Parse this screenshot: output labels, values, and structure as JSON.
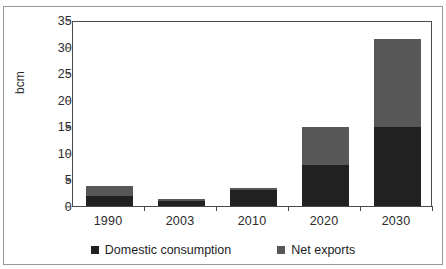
{
  "chart_data": {
    "type": "bar",
    "subtype": "stacked-column",
    "title": "",
    "xlabel": "",
    "ylabel": "bcm",
    "ylim": [
      0,
      35
    ],
    "ytick_step": 5,
    "yticks": [
      0,
      5,
      10,
      15,
      20,
      25,
      30,
      35
    ],
    "ytick_labels": [
      "0",
      "5",
      "10",
      "15",
      "20",
      "25",
      "30",
      "35"
    ],
    "categories": [
      "1990",
      "2003",
      "2010",
      "2020",
      "2030"
    ],
    "grid": false,
    "legend_position": "bottom",
    "series": [
      {
        "name": "Domestic consumption",
        "color": "#212121",
        "values": [
          2.0,
          1.2,
          3.2,
          8.0,
          15.0
        ]
      },
      {
        "name": "Net exports",
        "color": "#585858",
        "values": [
          2.0,
          0.3,
          0.4,
          7.0,
          16.7
        ]
      }
    ],
    "totals": [
      4.0,
      1.5,
      3.6,
      15.0,
      31.7
    ]
  },
  "legend": {
    "items": [
      {
        "label": "Domestic consumption",
        "color": "#212121"
      },
      {
        "label": "Net exports",
        "color": "#585858"
      }
    ]
  },
  "axis": {
    "y_label": "bcm"
  },
  "colors": {
    "domestic": "#212121",
    "exports": "#585858",
    "axis": "#4a4a4a",
    "frame": "#9a9a9a",
    "text": "#2b2b2b",
    "background": "#ffffff"
  }
}
